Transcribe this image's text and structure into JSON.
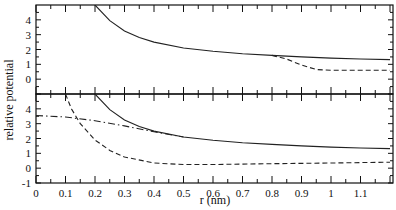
{
  "chart_data": {
    "type": "line",
    "title": "",
    "xlabel": "r (nm)",
    "ylabel": "relative potential",
    "xlim": [
      0,
      1.21
    ],
    "x_ticks": [
      "0",
      "0.1",
      "0.2",
      "0.3",
      "0.4",
      "0.5",
      "0.6",
      "0.7",
      "0.8",
      "0.9",
      "1",
      "1.1"
    ],
    "grid": false,
    "legend": null,
    "panels": [
      {
        "name": "top",
        "ylim": [
          -1,
          5
        ],
        "y_ticks": [
          "-1",
          "0",
          "1",
          "2",
          "3",
          "4"
        ],
        "series": [
          {
            "name": "solid",
            "style": "solid",
            "x": [
              0.2,
              0.25,
              0.3,
              0.35,
              0.4,
              0.5,
              0.6,
              0.7,
              0.8,
              0.9,
              1.0,
              1.1,
              1.2
            ],
            "y": [
              5.0,
              3.95,
              3.25,
              2.8,
              2.5,
              2.1,
              1.88,
              1.72,
              1.6,
              1.5,
              1.42,
              1.36,
              1.32
            ]
          },
          {
            "name": "dashed",
            "style": "dashed",
            "x": [
              0.8,
              0.85,
              0.9,
              0.95,
              1.0,
              1.1,
              1.2
            ],
            "y": [
              1.6,
              1.35,
              0.95,
              0.65,
              0.6,
              0.6,
              0.6
            ]
          }
        ]
      },
      {
        "name": "bottom",
        "ylim": [
          -1,
          5
        ],
        "y_ticks": [
          "-1",
          "0",
          "1",
          "2",
          "3",
          "4"
        ],
        "series": [
          {
            "name": "solid",
            "style": "solid",
            "x": [
              0.2,
              0.25,
              0.3,
              0.35,
              0.4,
              0.5,
              0.6,
              0.7,
              0.8,
              0.9,
              1.0,
              1.1,
              1.2
            ],
            "y": [
              5.0,
              3.95,
              3.25,
              2.8,
              2.5,
              2.1,
              1.88,
              1.72,
              1.6,
              1.5,
              1.42,
              1.36,
              1.32
            ]
          },
          {
            "name": "dashed",
            "style": "dashed",
            "x": [
              0.1,
              0.12,
              0.15,
              0.2,
              0.25,
              0.3,
              0.4,
              0.5,
              0.6,
              0.8,
              1.0,
              1.2
            ],
            "y": [
              5.0,
              4.0,
              3.0,
              1.9,
              1.2,
              0.75,
              0.35,
              0.25,
              0.25,
              0.3,
              0.35,
              0.4
            ]
          },
          {
            "name": "dash-dot",
            "style": "dashdot",
            "x": [
              0.0,
              0.1,
              0.2,
              0.3,
              0.4,
              0.5
            ],
            "y": [
              3.55,
              3.45,
              3.2,
              2.85,
              2.45,
              2.1
            ]
          }
        ]
      }
    ]
  }
}
